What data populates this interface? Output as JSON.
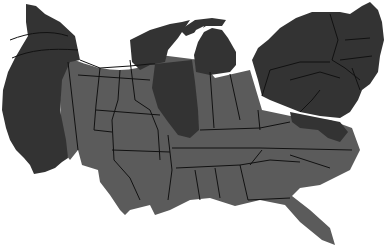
{
  "map": {
    "type": "cartogram",
    "subject": "United States (contiguous), distorted state areas",
    "background": "#ffffff",
    "legend": null,
    "title": null,
    "colors": {
      "dark": "#333333",
      "medium": "#5b5b5b",
      "border": "#111111"
    },
    "regions": [
      {
        "name": "west-coast",
        "shade": "dark"
      },
      {
        "name": "pacific-northwest",
        "shade": "dark"
      },
      {
        "name": "mountain-plains",
        "shade": "medium"
      },
      {
        "name": "texas",
        "shade": "medium"
      },
      {
        "name": "minnesota-wisconsin",
        "shade": "dark"
      },
      {
        "name": "illinois",
        "shade": "dark"
      },
      {
        "name": "michigan",
        "shade": "dark"
      },
      {
        "name": "indiana-ohio",
        "shade": "medium"
      },
      {
        "name": "northeast",
        "shade": "dark"
      },
      {
        "name": "southeast",
        "shade": "medium"
      },
      {
        "name": "florida",
        "shade": "medium"
      }
    ]
  }
}
